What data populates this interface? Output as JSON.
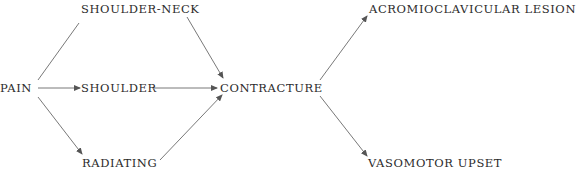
{
  "diagram": {
    "nodes": {
      "pain": "PAIN",
      "shoulder_neck": "SHOULDER-NECK",
      "shoulder": "SHOULDER",
      "radiating": "RADIATING",
      "contracture": "CONTRACTURE",
      "acromioclavicular_lesion": "ACROMIOCLAVICULAR LESION",
      "vasomotor_upset": "VASOMOTOR UPSET"
    },
    "edges": [
      {
        "from": "PAIN",
        "to": "SHOULDER-NECK"
      },
      {
        "from": "PAIN",
        "to": "SHOULDER"
      },
      {
        "from": "PAIN",
        "to": "RADIATING"
      },
      {
        "from": "SHOULDER-NECK",
        "to": "CONTRACTURE"
      },
      {
        "from": "SHOULDER",
        "to": "CONTRACTURE"
      },
      {
        "from": "RADIATING",
        "to": "CONTRACTURE"
      },
      {
        "from": "CONTRACTURE",
        "to": "ACROMIOCLAVICULAR LESION"
      },
      {
        "from": "CONTRACTURE",
        "to": "VASOMOTOR UPSET"
      }
    ],
    "colors": {
      "text": "#2b2b2b",
      "arrow": "#555555",
      "background": "#ffffff"
    }
  }
}
